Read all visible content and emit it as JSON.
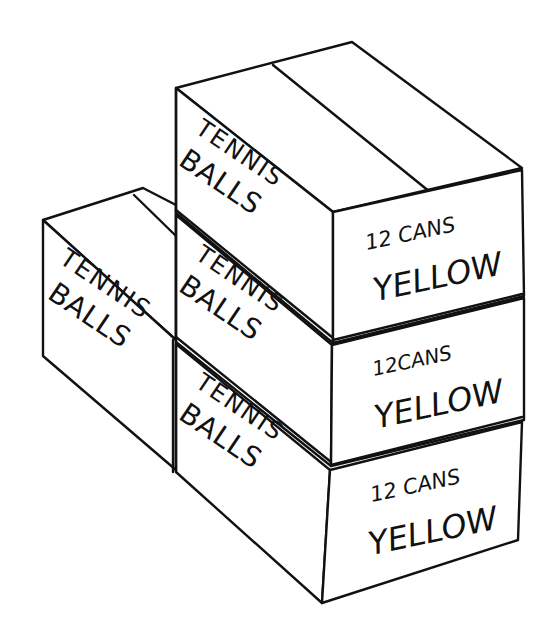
{
  "scene": {
    "description": "Line drawing of four stacked cardboard boxes labeled tennis balls",
    "background": "#ffffff",
    "ink": "#111111"
  },
  "boxes": {
    "left_box": {
      "side_label_1": "TENNIS",
      "side_label_2": "BALLS"
    },
    "stack_top": {
      "side_label_1": "TENNIS",
      "side_label_2": "BALLS",
      "end_label_1": "12 CANS",
      "end_label_2": "YELLOW"
    },
    "stack_middle": {
      "side_label_1": "TENNIS",
      "side_label_2": "BALLS",
      "end_label_1": "12CANS",
      "end_label_2": "YELLOW"
    },
    "stack_bottom": {
      "side_label_1": "TENNIS",
      "side_label_2": "BALLS",
      "end_label_1": "12 CANS",
      "end_label_2": "YELLOW"
    }
  }
}
